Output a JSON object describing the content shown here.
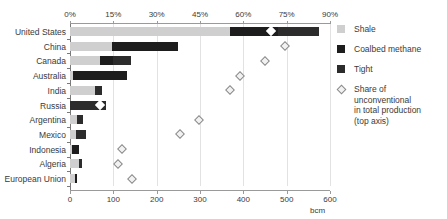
{
  "chart_data": {
    "type": "bar",
    "title": "",
    "orientation": "horizontal",
    "stacked": true,
    "xlabel": "bcm",
    "ylabel": "",
    "unit": "bcm",
    "grid": true,
    "legend_position": "right",
    "bottom_axis": {
      "label": "bcm",
      "min": 0,
      "max": 600,
      "ticks": [
        0,
        100,
        200,
        300,
        400,
        500,
        600
      ],
      "tick_labels": [
        "0",
        "100",
        "200",
        "300",
        "400",
        "500",
        "600"
      ]
    },
    "top_axis": {
      "label": "Share of unconventional in total production",
      "min": 0,
      "max": 90,
      "ticks": [
        0,
        15,
        30,
        45,
        60,
        75,
        90
      ],
      "tick_labels": [
        "0%",
        "15%",
        "30%",
        "45%",
        "60%",
        "75%",
        "90%"
      ]
    },
    "categories": [
      "United States",
      "China",
      "Canada",
      "Australia",
      "India",
      "Russia",
      "Argentina",
      "Mexico",
      "Indonesia",
      "Algeria",
      "European Union"
    ],
    "series": [
      {
        "name": "Shale",
        "color": "#cfcfcf",
        "values": [
          370,
          97,
          70,
          6,
          58,
          0,
          17,
          13,
          4,
          21,
          12
        ]
      },
      {
        "name": "Coalbed methane",
        "color": "#1d1d1d",
        "values": [
          110,
          152,
          30,
          126,
          0,
          0,
          0,
          0,
          16,
          0,
          4
        ]
      },
      {
        "name": "Tight",
        "color": "#2c2c2c",
        "values": [
          95,
          0,
          40,
          0,
          17,
          82,
          12,
          25,
          0,
          6,
          0
        ]
      }
    ],
    "marker_series": {
      "name": "Share of unconventional in total production (top axis)",
      "axis": "top",
      "unit": "%",
      "values": [
        69.5,
        74.5,
        67.5,
        59.0,
        55.5,
        10.5,
        44.5,
        38.0,
        18.0,
        16.5,
        21.5
      ]
    }
  },
  "legend": {
    "items": [
      {
        "label": "Shale",
        "swatch": "shale-swatch"
      },
      {
        "label": "Coalbed methane",
        "swatch": "coalbed-methane-swatch"
      },
      {
        "label": "Tight",
        "swatch": "tight-swatch"
      }
    ],
    "marker_item": {
      "line1": "Share of",
      "line2": "unconventional",
      "line3": "in total production",
      "line4": "(top axis)"
    }
  }
}
